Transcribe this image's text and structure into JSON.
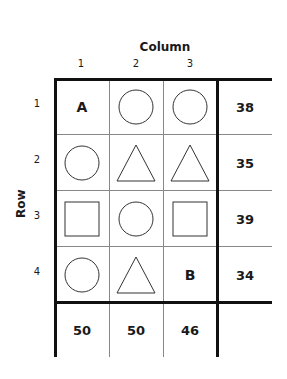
{
  "axes": {
    "column_title": "Column",
    "row_title": "Row",
    "columns": [
      "1",
      "2",
      "3"
    ],
    "rows": [
      "1",
      "2",
      "3",
      "4"
    ]
  },
  "grid": {
    "cells": [
      [
        "A",
        "circle",
        "circle"
      ],
      [
        "circle",
        "triangle",
        "triangle"
      ],
      [
        "square",
        "circle",
        "square"
      ],
      [
        "circle",
        "triangle",
        "B"
      ]
    ],
    "row_sums": [
      "38",
      "35",
      "39",
      "34"
    ],
    "column_sums": [
      "50",
      "50",
      "46"
    ]
  }
}
